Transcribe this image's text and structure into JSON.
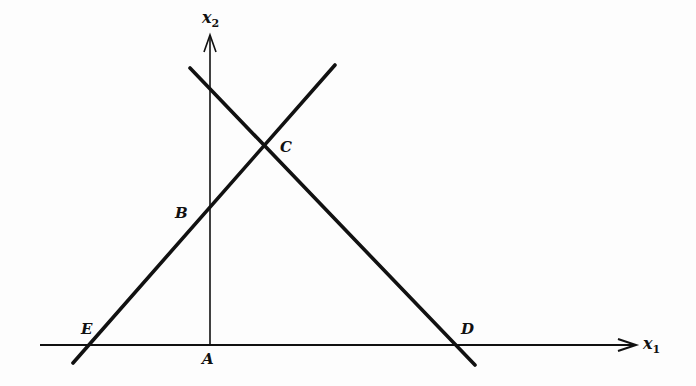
{
  "figure": {
    "colors": {
      "background": "#fdfdfd",
      "ink": "#111111"
    },
    "axes": {
      "x1": {
        "label": "x",
        "subscript": "1"
      },
      "x2": {
        "label": "x",
        "subscript": "2"
      }
    },
    "points": {
      "A": "A",
      "B": "B",
      "C": "C",
      "D": "D",
      "E": "E"
    },
    "lines": [
      {
        "name": "line-EBC",
        "passes_through": [
          "E",
          "B",
          "C"
        ]
      },
      {
        "name": "line-CD",
        "passes_through": [
          "C",
          "D"
        ]
      }
    ]
  }
}
